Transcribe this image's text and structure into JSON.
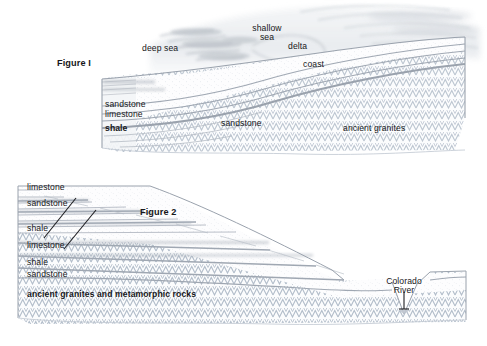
{
  "document": {
    "type": "geological-cross-section-diagram",
    "background_color": "#ffffff",
    "text_color": "#17171a",
    "stroke_color": "#8f98a6",
    "granite_pattern_color": "#b9c2cd",
    "strata_line_color": "#a6adb8"
  },
  "figure1": {
    "caption": "Figure I",
    "sea_labels": {
      "deep_sea": "deep sea",
      "shallow_sea_line1": "shallow",
      "shallow_sea_line2": "sea",
      "delta": "delta",
      "coast": "coast"
    },
    "strata_labels": {
      "sandstone_top": "sandstone",
      "limestone": "limestone",
      "shale": "shale",
      "sandstone_mid": "sandstone",
      "basement": "ancient granites"
    }
  },
  "figure2": {
    "caption": "Figure 2",
    "strata_labels": {
      "limestone_top": "limestone",
      "sandstone_upper": "sandstone",
      "shale_upper": "shale",
      "limestone_mid": "limestone",
      "shale_lower": "shale",
      "sandstone_lower": "sandstone",
      "basement": "ancient granites and metamorphic rocks"
    },
    "river_label_line1": "Colorado",
    "river_label_line2": "River"
  }
}
